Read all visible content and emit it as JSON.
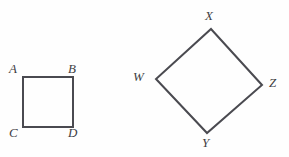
{
  "figure": {
    "background_color": "#fefefe",
    "stroke_color": "#4a4a50",
    "label_color": "#3f3f44",
    "stroke_width": 2,
    "width": 289,
    "height": 157,
    "shapes": [
      {
        "name": "square-abcd",
        "type": "square",
        "points": "23,77 73,77 73,127 23,127",
        "vertices": [
          {
            "id": "A",
            "label": "A",
            "x": 23,
            "y": 77
          },
          {
            "id": "B",
            "label": "B",
            "x": 73,
            "y": 77
          },
          {
            "id": "C",
            "label": "C",
            "x": 23,
            "y": 127
          },
          {
            "id": "D",
            "label": "D",
            "x": 73,
            "y": 127
          }
        ]
      },
      {
        "name": "quadrilateral-wxyz",
        "type": "quadrilateral",
        "points": "211,29 262,85 207,133 156,79",
        "vertices": [
          {
            "id": "W",
            "label": "W",
            "x": 156,
            "y": 79
          },
          {
            "id": "X",
            "label": "X",
            "x": 211,
            "y": 29
          },
          {
            "id": "Y",
            "label": "Y",
            "x": 207,
            "y": 133
          },
          {
            "id": "Z",
            "label": "Z",
            "x": 262,
            "y": 85
          }
        ]
      }
    ]
  }
}
